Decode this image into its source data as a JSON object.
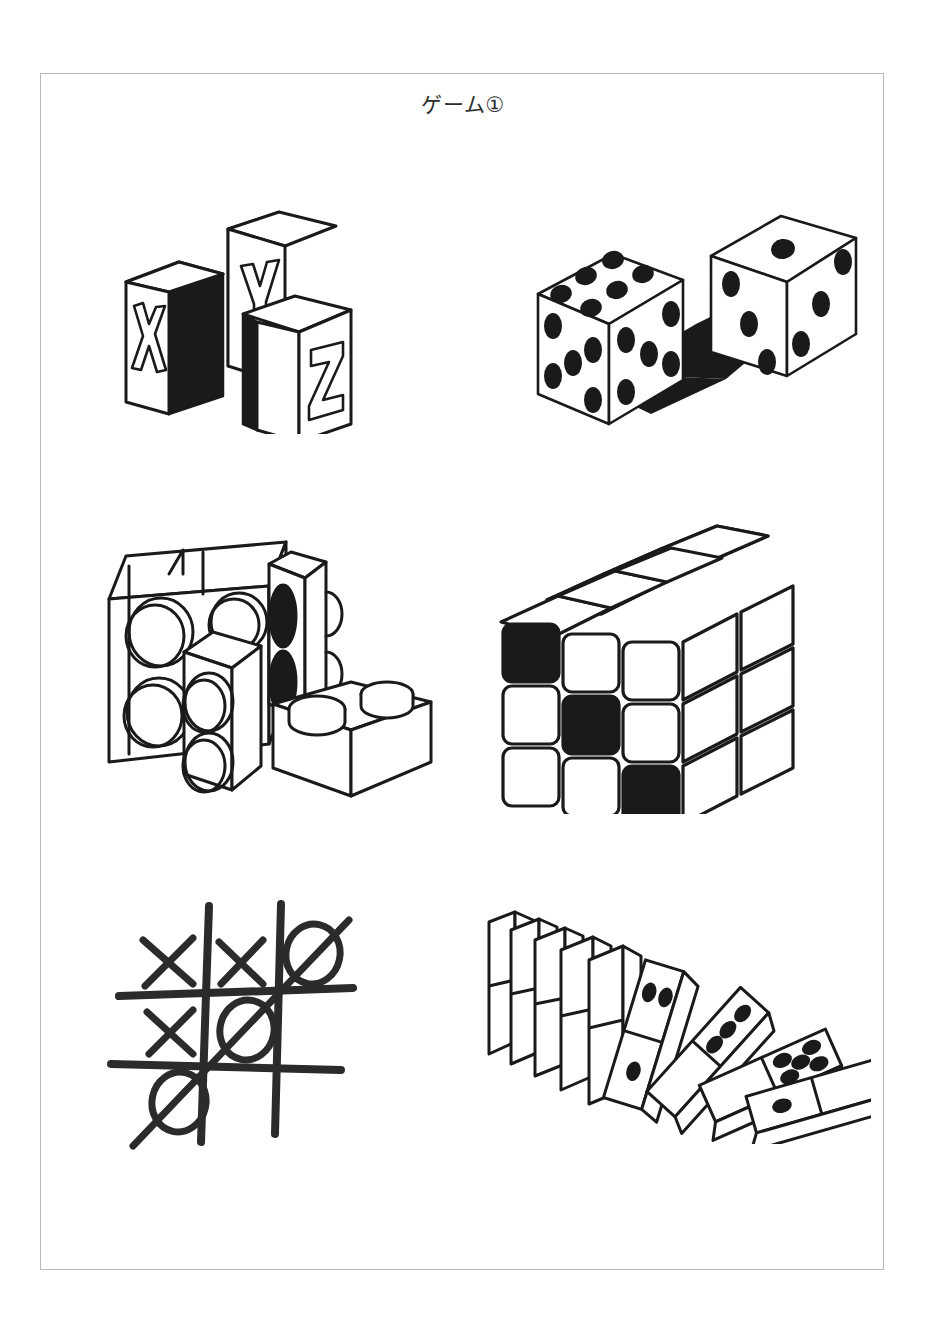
{
  "page": {
    "title": "ゲーム①",
    "background_color": "#ffffff",
    "border_color": "#b9b9b9",
    "ink_color": "#1a1a1a",
    "sheet": {
      "x": 40,
      "y": 73,
      "width": 844,
      "height": 1197
    }
  },
  "illustrations": [
    {
      "id": "alphabet-blocks",
      "name": "alphabet-blocks",
      "label": "Alphabet blocks",
      "position": "top-left",
      "letters": [
        "X",
        "Y",
        "Z"
      ],
      "block_count": 3,
      "style": "line-drawing with solid black shaded side faces"
    },
    {
      "id": "dice",
      "name": "dice-pair",
      "label": "Pair of dice",
      "position": "top-right",
      "count": 2,
      "dice": [
        {
          "name": "front-die",
          "top_face": 6,
          "left_face": 5,
          "right_face": 5
        },
        {
          "name": "back-die",
          "top_face": 1,
          "left_face": 3,
          "right_face": 3
        }
      ],
      "has_shadow": true
    },
    {
      "id": "building-blocks",
      "name": "building-blocks",
      "label": "Interlocking building bricks",
      "position": "middle-left",
      "brick_count": 4,
      "black_studs": 2
    },
    {
      "id": "rubiks-cube",
      "name": "rubiks-cube",
      "label": "3x3 puzzle cube",
      "position": "middle-right",
      "grid": 3,
      "front_face": [
        [
          "black",
          "white",
          "white"
        ],
        [
          "white",
          "black",
          "white"
        ],
        [
          "white",
          "white",
          "black"
        ]
      ],
      "top_face": [
        [
          "white",
          "white",
          "white"
        ],
        [
          "white",
          "white",
          "white"
        ],
        [
          "white",
          "white",
          "white"
        ]
      ],
      "right_face": [
        [
          "white",
          "white",
          "white"
        ],
        [
          "white",
          "white",
          "white"
        ],
        [
          "white",
          "white",
          "white"
        ]
      ]
    },
    {
      "id": "tic-tac-toe",
      "name": "tic-tac-toe",
      "label": "Tic-tac-toe board",
      "position": "bottom-left",
      "board": [
        [
          "X",
          "X",
          "O"
        ],
        [
          "X",
          "O",
          ""
        ],
        [
          "O",
          "",
          ""
        ]
      ],
      "winner": "O",
      "winning_line": "anti-diagonal",
      "strike_through": true
    },
    {
      "id": "dominoes",
      "name": "dominoes-chain",
      "label": "Falling domino chain",
      "position": "bottom-right",
      "total_tiles": 9,
      "standing_tiles": 5,
      "falling_tiles": 4,
      "visible_pips": [
        {
          "tile": 1,
          "top_half": 2,
          "bottom_half": 1
        },
        {
          "tile": 2,
          "top_half": 3,
          "bottom_half": 0
        },
        {
          "tile": 3,
          "top_half": 5,
          "bottom_half": 0
        },
        {
          "tile": 4,
          "top_half": 0,
          "bottom_half": 1
        }
      ]
    }
  ]
}
